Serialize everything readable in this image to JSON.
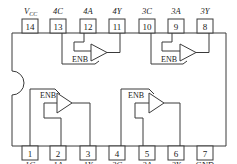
{
  "diagram": {
    "type": "ic-pinout",
    "package_pins": 14,
    "top_pins": [
      {
        "number": "14",
        "label": "VCC",
        "label_main": "V",
        "label_sub": "CC"
      },
      {
        "number": "13",
        "label": "4C"
      },
      {
        "number": "12",
        "label": "4A"
      },
      {
        "number": "11",
        "label": "4Y"
      },
      {
        "number": "10",
        "label": "3C"
      },
      {
        "number": "9",
        "label": "3A"
      },
      {
        "number": "8",
        "label": "3Y"
      }
    ],
    "bottom_pins": [
      {
        "number": "1",
        "label": "1C"
      },
      {
        "number": "2",
        "label": "1A"
      },
      {
        "number": "3",
        "label": "1Y"
      },
      {
        "number": "4",
        "label": "2C"
      },
      {
        "number": "5",
        "label": "2A"
      },
      {
        "number": "6",
        "label": "2Y"
      },
      {
        "number": "7",
        "label": "GND"
      }
    ],
    "buffers": [
      {
        "id": "buffer-4",
        "enable_label": "ENB",
        "input": "4A",
        "output": "4Y",
        "control": "4C"
      },
      {
        "id": "buffer-3",
        "enable_label": "ENB",
        "input": "3A",
        "output": "3Y",
        "control": "3C"
      },
      {
        "id": "buffer-1",
        "enable_label": "ENB",
        "input": "1A",
        "output": "1Y",
        "control": "1C"
      },
      {
        "id": "buffer-2",
        "enable_label": "ENB",
        "input": "2A",
        "output": "2Y",
        "control": "2C"
      }
    ]
  }
}
